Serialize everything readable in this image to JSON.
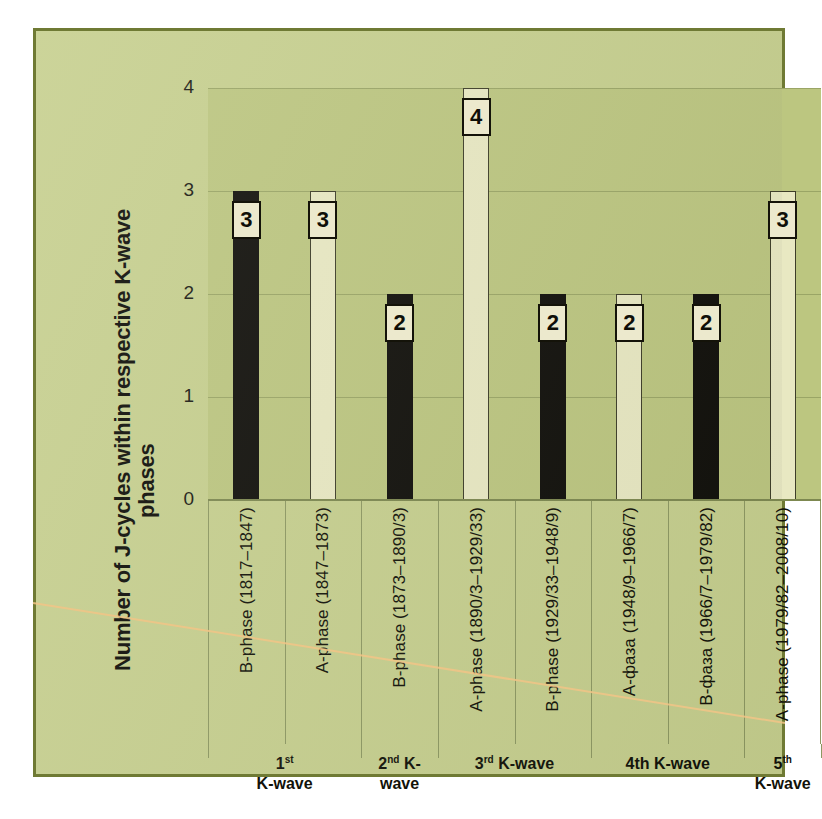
{
  "chart_data": {
    "type": "bar",
    "title": "",
    "xlabel": "",
    "ylabel": "Number of J-cycles within respective K-wave phases",
    "ylim": [
      0,
      4
    ],
    "yticks": [
      0,
      1,
      2,
      3,
      4
    ],
    "grid": true,
    "legend": "none",
    "categories": [
      "B-phase (1817–1847)",
      "A-phase (1847–1873)",
      "B-phase (1873–1890/3)",
      "A-phase (1890/3–1929/33)",
      "B-phase (1929/33–1948/9)",
      "A-фаза (1948/9–1966/7)",
      "B-фаза (1966/7–1979/82)",
      "A-phase (1979/82–2008/10)"
    ],
    "values": [
      3,
      3,
      2,
      4,
      2,
      2,
      2,
      3
    ],
    "bar_styles": [
      "dark",
      "light",
      "dark",
      "light",
      "dark",
      "light",
      "dark",
      "light"
    ],
    "groups": [
      {
        "label_html": "1<sup>st</sup><br>K-wave",
        "label_text": "1st K-wave",
        "span": 2
      },
      {
        "label_html": "2<sup>nd</sup> K-wave",
        "label_text": "2nd K-wave",
        "span": 1
      },
      {
        "label_html": "3<sup>rd</sup> K-wave",
        "label_text": "3rd K-wave",
        "span": 2
      },
      {
        "label_html": "4th K-wave",
        "label_text": "4th K-wave",
        "span": 2
      },
      {
        "label_html": "5<sup>th</sup><br>K-wave",
        "label_text": "5th K-wave",
        "span": 1
      }
    ]
  },
  "ytitle": {
    "line1": "Number of J-cycles within respective K-wave",
    "line2": "phases"
  },
  "colors": {
    "page_background": "#ffffff",
    "chart_background": "#c6cf8e",
    "chart_border": "#6f7a34",
    "plot_background": "#bcc680",
    "gridline": "#9aa566",
    "bar_dark": "#100f0a",
    "bar_light": "#e8e8c2",
    "label_box_fill": "#ece9cd",
    "label_box_border": "#141309",
    "text": "#121209",
    "scan_line": "#f0c080"
  }
}
